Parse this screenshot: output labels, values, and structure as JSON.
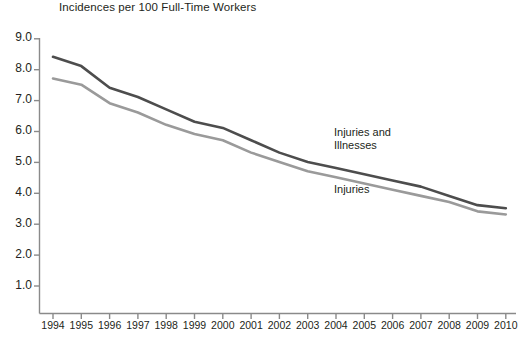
{
  "chart_data": {
    "type": "line",
    "title": "Incidences per 100 Full-Time Workers",
    "xlabel": "",
    "ylabel": "",
    "x": [
      1994,
      1995,
      1996,
      1997,
      1998,
      1999,
      2000,
      2001,
      2002,
      2003,
      2004,
      2005,
      2006,
      2007,
      2008,
      2009,
      2010
    ],
    "categories": [
      "1994",
      "1995",
      "1996",
      "1997",
      "1998",
      "1999",
      "2000",
      "2001",
      "2002",
      "2003",
      "2004",
      "2005",
      "2006",
      "2007",
      "2008",
      "2009",
      "2010"
    ],
    "ylim": [
      0,
      9.0
    ],
    "yticks": [
      "1.0",
      "2.0",
      "3.0",
      "4.0",
      "5.0",
      "6.0",
      "7.0",
      "8.0",
      "9.0"
    ],
    "ytick_values": [
      1.0,
      2.0,
      3.0,
      4.0,
      5.0,
      6.0,
      7.0,
      8.0,
      9.0
    ],
    "grid": false,
    "legend_position": "inline-annotation",
    "series": [
      {
        "name": "Injuries and Illnesses",
        "color": "#4d4d4d",
        "values": [
          8.4,
          8.1,
          7.4,
          7.1,
          6.7,
          6.3,
          6.1,
          5.7,
          5.3,
          5.0,
          4.8,
          4.6,
          4.4,
          4.2,
          3.9,
          3.6,
          3.5
        ]
      },
      {
        "name": "Injuries",
        "color": "#9a9a9a",
        "values": [
          7.7,
          7.5,
          6.9,
          6.6,
          6.2,
          5.9,
          5.7,
          5.3,
          5.0,
          4.7,
          4.5,
          4.3,
          4.1,
          3.9,
          3.7,
          3.4,
          3.3
        ]
      }
    ],
    "annotations": [
      {
        "text_line1": "Injuries and",
        "text_line2": "Illnesses"
      },
      {
        "text_line1": "Injuries",
        "text_line2": ""
      }
    ],
    "axis_color": "#8a8a8a"
  },
  "labels": {
    "series_injuries_illnesses_l1": "Injuries and",
    "series_injuries_illnesses_l2": "Illnesses",
    "series_injuries": "Injuries"
  }
}
